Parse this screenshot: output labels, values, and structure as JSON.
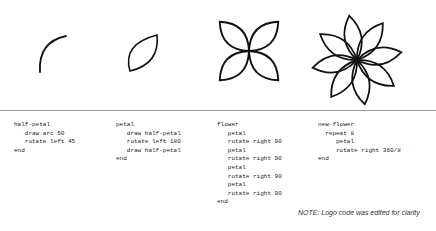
{
  "figures": [
    {
      "name": "half-petal",
      "description": "single quarter arc"
    },
    {
      "name": "petal",
      "description": "two arcs forming a petal"
    },
    {
      "name": "flower",
      "description": "four petals rotated 90 degrees"
    },
    {
      "name": "new-flower",
      "description": "eight petals rotated 360/8 degrees"
    }
  ],
  "code_blocks": [
    {
      "title": "half-petal",
      "text": "half-petal\n   draw arc 50\n   rotate left 45\nend"
    },
    {
      "title": "petal",
      "text": "petal\n   draw half-petal\n   rotate left 180\n   draw half-petal\nend"
    },
    {
      "title": "flower",
      "text": "flower\n   petal\n   rotate right 90\n   petal\n   rotate right 90\n   petal\n   rotate right 90\n   petal\n   rotate right 90\nend"
    },
    {
      "title": "new-flower",
      "text": "new-flower\n  repeat 8\n     petal\n     rotate right 360/8\nend"
    }
  ],
  "note": "NOTE: Logo code was edited for clarity",
  "colors": {
    "stroke": "#111111",
    "divider": "#9a9a9a"
  }
}
